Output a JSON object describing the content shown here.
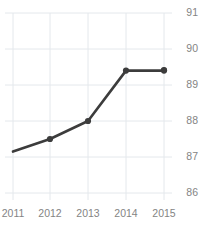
{
  "chart_data": {
    "type": "line",
    "title": "Freedom Trend",
    "xlabel": "",
    "ylabel": "",
    "x": [
      "2011",
      "2012",
      "2013",
      "2014",
      "2015"
    ],
    "categories": [
      "2011",
      "2012",
      "2013",
      "2014",
      "2015"
    ],
    "values": [
      87.15,
      87.5,
      88.0,
      89.4,
      89.4
    ],
    "series": [
      {
        "name": "Freedom Trend",
        "values": [
          87.15,
          87.5,
          88.0,
          89.4,
          89.4
        ]
      }
    ],
    "ylim": [
      86,
      91
    ],
    "yticks": [
      86,
      87,
      88,
      89,
      90,
      91
    ],
    "ytick_labels": [
      "86",
      "87",
      "88",
      "89",
      "90",
      "91"
    ],
    "xtick_labels": [
      "2011",
      "2012",
      "2013",
      "2014",
      "2015"
    ],
    "grid": true,
    "grid_axis": "both",
    "legend": false,
    "legend_position": "none",
    "y_axis_side": "right",
    "markers": true,
    "line_color": "#3c3c3c",
    "marker_color": "#3c3c3c",
    "grid_color": "#e4e8ec",
    "tick_label_color": "#848484",
    "title_color": "#3f3f3f",
    "background_color": "#ffffff"
  }
}
